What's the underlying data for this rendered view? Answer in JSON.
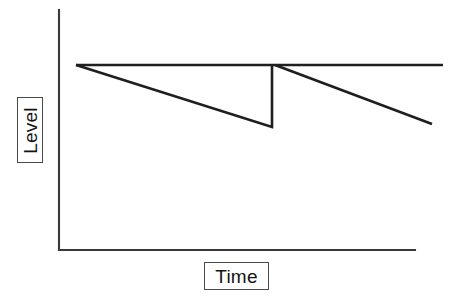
{
  "figure": {
    "name": "level-vs-time-sawtooth",
    "background_color": "#ffffff",
    "line_color": "#1f1f1f",
    "axis_color": "#3a3a3a",
    "label_border_color": "#4a4a4a"
  },
  "axes": {
    "y_label": "Level",
    "x_label": "Time",
    "y_axis": {
      "x": 59,
      "y_top": 10,
      "y_bottom": 250
    },
    "x_axis": {
      "y": 250,
      "x_left": 59,
      "x_right": 415
    }
  },
  "chart_data": {
    "type": "line",
    "title": "",
    "xlabel": "Time",
    "ylabel": "Level",
    "grid": false,
    "legend": null,
    "axis_ticks": {
      "x": [],
      "y": []
    },
    "xlim": [
      0,
      1
    ],
    "ylim": [
      0,
      1
    ],
    "annotations": [],
    "series": [
      {
        "name": "reference-level",
        "description": "Flat horizontal maximum level line held across the whole time span",
        "points": [
          {
            "x": 76,
            "y": 65
          },
          {
            "x": 443,
            "y": 65
          }
        ]
      },
      {
        "name": "depletion-cycle-1",
        "description": "Level declines steadily from the maximum to a low point, then is instantaneously replenished back to the maximum",
        "points": [
          {
            "x": 76,
            "y": 65
          },
          {
            "x": 272,
            "y": 127
          },
          {
            "x": 272,
            "y": 65
          }
        ]
      },
      {
        "name": "depletion-cycle-2",
        "description": "Second, steeper decline beginning at the replenishment point and continuing to the right edge",
        "points": [
          {
            "x": 275,
            "y": 65
          },
          {
            "x": 432,
            "y": 124
          }
        ]
      }
    ]
  }
}
